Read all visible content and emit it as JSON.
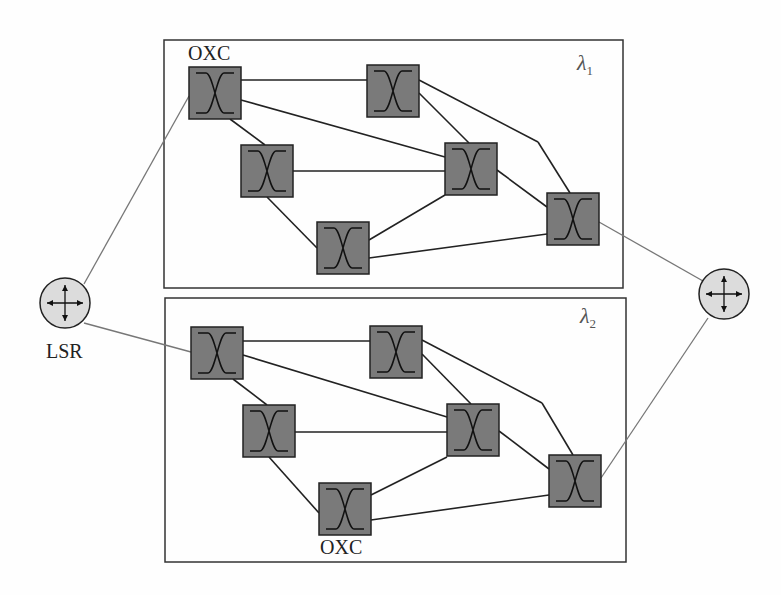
{
  "labels": {
    "oxc_top": "OXC",
    "oxc_bottom": "OXC",
    "lsr": "LSR",
    "lambda_symbol": "λ",
    "lambda1_sub": "1",
    "lambda2_sub": "2"
  },
  "colors": {
    "node_fill": "#7a7a7a",
    "router_fill": "#dcdcdc",
    "line": "#222222",
    "access_line": "#777777"
  },
  "planes": [
    {
      "name": "lambda-1",
      "box": [
        164,
        40,
        459,
        248
      ]
    },
    {
      "name": "lambda-2",
      "box": [
        165,
        298,
        461,
        264
      ]
    }
  ]
}
